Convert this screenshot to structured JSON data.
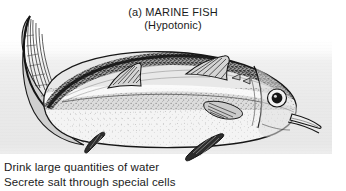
{
  "figure": {
    "label": "(a) MARINE FISH",
    "subtitle": "(Hypotonic)",
    "caption_lines": [
      "Drink large quantities of water",
      "Secrete salt through special cells"
    ],
    "illustration": {
      "subject": "marine-fish-line-drawing",
      "parts": [
        "caudal-fin",
        "first-dorsal-fin",
        "second-dorsal-fin",
        "pectoral-fin",
        "pelvic-fin",
        "anal-fin",
        "eye",
        "gill-cover",
        "mouth",
        "lateral-line"
      ]
    },
    "colors": {
      "text": "#1b1b1b",
      "panel_background": "#eaeaea",
      "page_background": "#ffffff",
      "ink": "#1a1a1a",
      "body_light": "#fdfdfd",
      "body_mid": "#b9b9b9",
      "body_dark": "#4a4a4a"
    }
  }
}
